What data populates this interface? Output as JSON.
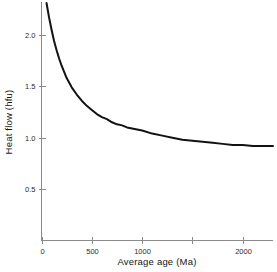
{
  "chart_data": {
    "type": "line",
    "title": "",
    "xlabel": "Average age (Ma)",
    "ylabel": "Heat flow (hfu)",
    "xlim": [
      0,
      2300
    ],
    "ylim": [
      0,
      2.32
    ],
    "grid": false,
    "legend": null,
    "series": [
      {
        "name": "Heat flow vs average age",
        "x": [
          50,
          75,
          100,
          125,
          150,
          175,
          200,
          250,
          300,
          350,
          400,
          450,
          500,
          550,
          600,
          650,
          700,
          750,
          800,
          850,
          900,
          950,
          1000,
          1100,
          1200,
          1300,
          1400,
          1500,
          1600,
          1700,
          1800,
          1900,
          2000,
          2100,
          2200,
          2300
        ],
        "y": [
          2.31,
          2.17,
          2.05,
          1.94,
          1.85,
          1.77,
          1.7,
          1.58,
          1.49,
          1.42,
          1.36,
          1.31,
          1.27,
          1.23,
          1.2,
          1.18,
          1.15,
          1.13,
          1.12,
          1.1,
          1.09,
          1.08,
          1.07,
          1.04,
          1.02,
          1.0,
          0.98,
          0.97,
          0.96,
          0.95,
          0.94,
          0.93,
          0.93,
          0.92,
          0.92,
          0.92
        ]
      }
    ],
    "xticks": [
      {
        "value": 0,
        "label": "0",
        "labeled": true
      },
      {
        "value": 500,
        "label": "500",
        "labeled": true
      },
      {
        "value": 1000,
        "label": "1000",
        "labeled": true
      },
      {
        "value": 1500,
        "label": "",
        "labeled": false
      },
      {
        "value": 2000,
        "label": "2000",
        "labeled": true
      }
    ],
    "yticks": [
      {
        "value": 0.5,
        "label": "0.5",
        "labeled": true
      },
      {
        "value": 1.0,
        "label": "1.0",
        "labeled": true
      },
      {
        "value": 1.5,
        "label": "1.5",
        "labeled": true
      },
      {
        "value": 2.0,
        "label": "2.0",
        "labeled": true
      }
    ],
    "asymptote": 0.92,
    "colors": {
      "curve": "#121212",
      "axis": "#8a8a8a",
      "background": "#ffffff",
      "text": "#151515"
    }
  }
}
